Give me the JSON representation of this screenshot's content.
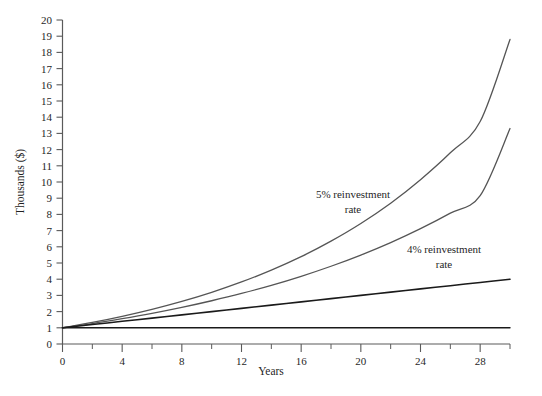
{
  "chart_data": {
    "type": "line",
    "title": "",
    "subtitle": "",
    "xlabel": "Years",
    "ylabel": "Thousands ($)",
    "xlim": [
      0,
      30
    ],
    "ylim": [
      0,
      20
    ],
    "xticks": [
      0,
      4,
      8,
      12,
      16,
      20,
      24,
      28
    ],
    "xticklabels": [
      "0",
      "4",
      "8",
      "12",
      "16",
      "20",
      "24",
      "28"
    ],
    "x_minor_tick_step": 2,
    "yticks": [
      0,
      1,
      2,
      3,
      4,
      5,
      6,
      7,
      8,
      9,
      10,
      11,
      12,
      13,
      14,
      15,
      16,
      17,
      18,
      19,
      20
    ],
    "yticklabels": [
      "0",
      "1",
      "2",
      "3",
      "4",
      "5",
      "6",
      "7",
      "8",
      "9",
      "10",
      "11",
      "12",
      "13",
      "14",
      "15",
      "16",
      "17",
      "18",
      "19",
      "20"
    ],
    "grid": false,
    "legend_position": "inline-annotation",
    "x": [
      0,
      2,
      4,
      6,
      8,
      10,
      12,
      14,
      16,
      18,
      20,
      22,
      24,
      26,
      28,
      30
    ],
    "series": [
      {
        "name": "5% reinvestment rate",
        "color": "#555555",
        "width": 1.3,
        "values": [
          1.0,
          1.33,
          1.71,
          2.14,
          2.63,
          3.19,
          3.83,
          4.56,
          5.39,
          6.35,
          7.44,
          8.69,
          10.14,
          11.8,
          13.73,
          18.8
        ]
      },
      {
        "name": "4% reinvestment rate",
        "color": "#555555",
        "width": 1.3,
        "values": [
          1.0,
          1.26,
          1.56,
          1.89,
          2.26,
          2.67,
          3.12,
          3.62,
          4.18,
          4.8,
          5.49,
          6.26,
          7.12,
          8.08,
          9.16,
          13.3
        ]
      },
      {
        "name": "principal plus simple interest",
        "color": "#1a1a1a",
        "width": 1.6,
        "values": [
          1.0,
          1.2,
          1.4,
          1.6,
          1.8,
          2.0,
          2.2,
          2.4,
          2.6,
          2.8,
          3.0,
          3.2,
          3.4,
          3.6,
          3.8,
          4.0
        ]
      },
      {
        "name": "principal only",
        "color": "#1a1a1a",
        "width": 1.4,
        "values": [
          1.0,
          1.0,
          1.0,
          1.0,
          1.0,
          1.0,
          1.0,
          1.0,
          1.0,
          1.0,
          1.0,
          1.0,
          1.0,
          1.0,
          1.0,
          1.0
        ]
      }
    ],
    "annotations": [
      {
        "id": "annotation-5pct",
        "line1": "5% reinvestment",
        "line2": "rate",
        "x_px": 353,
        "y_px": 198
      },
      {
        "id": "annotation-4pct",
        "line1": "4% reinvestment",
        "line2": "rate",
        "x_px": 444,
        "y_px": 253
      }
    ],
    "colors": {
      "axis": "#5a5a5a",
      "text": "#1f1f1f",
      "curve_gray": "#555555",
      "curve_dark": "#1a1a1a",
      "background": "#ffffff"
    }
  }
}
